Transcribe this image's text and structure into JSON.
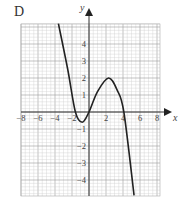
{
  "panel_label": "D",
  "chart_data": {
    "type": "line",
    "title": "D",
    "xlabel": "x",
    "ylabel": "y",
    "xlim": [
      -8,
      8.4
    ],
    "ylim": [
      -4.9,
      5.2
    ],
    "grid": true,
    "x_ticks": [
      -8,
      -6,
      -4,
      -2,
      2,
      4,
      6,
      8
    ],
    "x_tick_labels": [
      "−8",
      "−6",
      "−4",
      "−2",
      "2",
      "4",
      "6",
      "8"
    ],
    "y_ticks": [
      4,
      3,
      2,
      1,
      -1,
      -2,
      -3,
      -4
    ],
    "y_tick_labels": [
      "4",
      "3",
      "2",
      "1",
      "−1",
      "−2",
      "−3",
      "−4"
    ],
    "series": [
      {
        "name": "cubic curve",
        "x": [
          -3.6,
          -2.5,
          -1.6,
          -0.8,
          0,
          1,
          2.3,
          3.3,
          4.1,
          5.3
        ],
        "y": [
          5.2,
          2.5,
          0,
          -0.6,
          0,
          1.2,
          2.0,
          1.3,
          0,
          -4.9
        ]
      }
    ],
    "features": {
      "local_min": [
        -0.8,
        -0.6
      ],
      "local_max": [
        2.3,
        2.0
      ],
      "x_intercepts": [
        -1.6,
        0,
        4.1
      ]
    }
  }
}
